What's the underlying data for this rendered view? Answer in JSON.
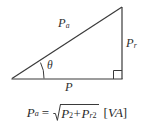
{
  "figure": {
    "name": "power-triangle-diagram",
    "background_color": "#ffffff",
    "stroke_color": "#3a3a3a",
    "text_color": "#2f2f2f"
  },
  "diagram": {
    "hypotenuse_label": "P",
    "hypotenuse_subscript": "a",
    "vertical_label": "P",
    "vertical_subscript": "r",
    "base_label": "P",
    "angle_label": "θ",
    "right_angle_marker": "right-angle-square",
    "vertices": {
      "left": [
        12,
        78
      ],
      "top_right": [
        122,
        7
      ],
      "bottom_right": [
        122,
        79
      ]
    }
  },
  "formula": {
    "lhs_symbol": "P",
    "lhs_subscript": "a",
    "equals": "=",
    "radical": "√",
    "term1_symbol": "P",
    "term1_exponent": "2",
    "plus": "+",
    "term2_symbol": "P",
    "term2_subscript": "r",
    "term2_exponent": "2",
    "unit_open": "[",
    "unit_text": "VA",
    "unit_close": "]",
    "plain_text": "P_a = sqrt(P^2 + P_r^2)  [VA]"
  }
}
